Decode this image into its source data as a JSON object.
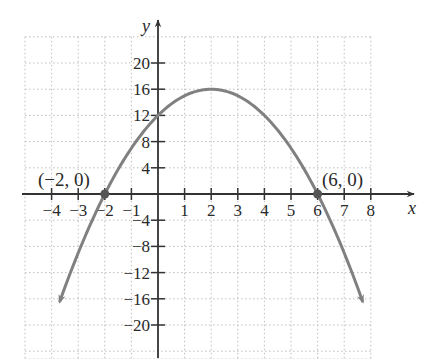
{
  "chart_data": {
    "type": "line",
    "title": "",
    "function": "y = -x^2 + 4x + 12",
    "xlabel": "x",
    "ylabel": "y",
    "xlim": [
      -5,
      9.5
    ],
    "ylim": [
      -24,
      24
    ],
    "grid": true,
    "x_ticks": [
      -4,
      -3,
      -2,
      -1,
      1,
      2,
      3,
      4,
      5,
      6,
      7,
      8
    ],
    "x_tick_labels": [
      "−4",
      "−3",
      "−2",
      "−1",
      "1",
      "2",
      "3",
      "4",
      "5",
      "6",
      "7",
      "8"
    ],
    "y_ticks": [
      20,
      16,
      12,
      8,
      4,
      -4,
      -8,
      -12,
      -16,
      -20
    ],
    "y_tick_labels": [
      "20",
      "16",
      "12",
      "8",
      "4",
      "−4",
      "−8",
      "−12",
      "−16",
      "−20"
    ],
    "series": [
      {
        "name": "parabola",
        "color": "#808080",
        "x": [
          -3.7,
          -3,
          -2,
          -1,
          0,
          1,
          2,
          3,
          4,
          5,
          6,
          7,
          7.7
        ],
        "y": [
          -23.49,
          -9,
          0,
          7,
          12,
          15,
          16,
          15,
          12,
          7,
          0,
          -9,
          -15.49
        ],
        "arrows": "both"
      }
    ],
    "annotations": [
      {
        "text": "(−2, 0)",
        "x": -2,
        "y": 0,
        "marker": "dot"
      },
      {
        "text": "(6, 0)",
        "x": 6,
        "y": 0,
        "marker": "dot"
      }
    ],
    "vertex": {
      "x": 2,
      "y": 16
    }
  },
  "colors": {
    "curve": "#808080",
    "axis": "#333333",
    "grid": "#bdbdbd",
    "dot": "#555555"
  },
  "labels": {
    "x_axis": "x",
    "y_axis": "y",
    "left_root": "(−2, 0)",
    "right_root": "(6, 0)"
  }
}
